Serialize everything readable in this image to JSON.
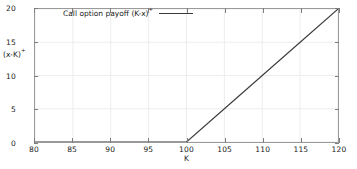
{
  "chart_data": {
    "type": "line",
    "title": "",
    "xlabel": "K",
    "ylabel": "(x-K)+",
    "ylabel_base": "(x-K)",
    "ylabel_sup": "+",
    "xlim": [
      80,
      120
    ],
    "ylim": [
      0,
      20
    ],
    "grid": true,
    "legend_position": "top-left-inside",
    "series": [
      {
        "name": "Call option payoff (K-x)+",
        "name_base": "Call option payoff (K-x)",
        "name_sup": "+",
        "color": "#3a3a3a",
        "strike": 100,
        "x": [
          80,
          85,
          90,
          95,
          100,
          105,
          110,
          115,
          120
        ],
        "values": [
          0,
          0,
          0,
          0,
          0,
          5,
          10,
          15,
          20
        ]
      }
    ],
    "xticks": [
      {
        "value": 80,
        "label": "80"
      },
      {
        "value": 85,
        "label": "85"
      },
      {
        "value": 90,
        "label": "90"
      },
      {
        "value": 95,
        "label": "95"
      },
      {
        "value": 100,
        "label": "100"
      },
      {
        "value": 105,
        "label": "105"
      },
      {
        "value": 110,
        "label": "110"
      },
      {
        "value": 115,
        "label": "115"
      },
      {
        "value": 120,
        "label": "120"
      }
    ],
    "yticks": [
      {
        "value": 0,
        "label": "0"
      },
      {
        "value": 5,
        "label": "5"
      },
      {
        "value": 10,
        "label": "10"
      },
      {
        "value": 15,
        "label": "15"
      },
      {
        "value": 20,
        "label": "20"
      }
    ],
    "colors": {
      "line": "#3a3a3a",
      "frame": "#9a9a9a",
      "grid": "#ededed",
      "text": "#1a1a1a",
      "background": "#ffffff"
    }
  }
}
